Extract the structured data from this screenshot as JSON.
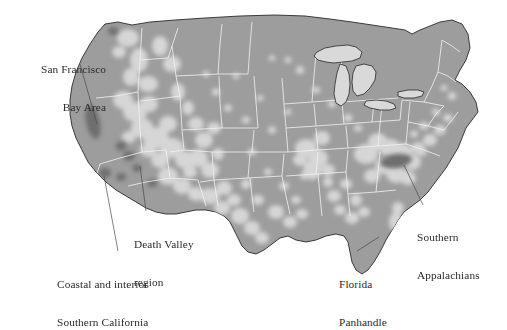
{
  "figure": {
    "type": "map",
    "region": "Contiguous United States",
    "style": "grayscale shaded density map with state boundaries",
    "background_color": "#ffffff",
    "colors": {
      "base_land": "#9d9d9d",
      "light_zone": "#d6d6d6",
      "dark_hotspot": "#6e6e6e",
      "state_border": "#f2f2f2",
      "coastline": "#2a2a2a",
      "lake_fill": "#d9d9d9",
      "label_text": "#2b2b2b",
      "leader_line": "#4a4a4a"
    }
  },
  "annotations": [
    {
      "id": "san-francisco-bay-area",
      "lines": [
        "San Francisco",
        "Bay Area"
      ],
      "line1": "San Francisco",
      "line2": "Bay Area",
      "anchor": {
        "x": 97,
        "y": 124
      },
      "leader_from": {
        "x": 80,
        "y": 64
      }
    },
    {
      "id": "death-valley-region",
      "lines": [
        "Death Valley",
        "region"
      ],
      "line1": "Death Valley",
      "line2": "region",
      "anchor": {
        "x": 140,
        "y": 166
      },
      "leader_from": {
        "x": 146,
        "y": 211
      }
    },
    {
      "id": "coastal-interior-southern-california",
      "lines": [
        "Coastal and interior",
        "Southern California"
      ],
      "line1": "Coastal and interior",
      "line2": "Southern California",
      "anchor": {
        "x": 104,
        "y": 176
      },
      "leader_from": {
        "x": 118,
        "y": 251
      }
    },
    {
      "id": "florida-panhandle",
      "lines": [
        "Florida",
        "Panhandle"
      ],
      "line1": "Florida",
      "line2": "Panhandle",
      "anchor": {
        "x": 379,
        "y": 237
      },
      "leader_from": {
        "x": 357,
        "y": 251
      }
    },
    {
      "id": "southern-appalachians",
      "lines": [
        "Southern",
        "Appalachians"
      ],
      "line1": "Southern",
      "line2": "Appalachians",
      "anchor": {
        "x": 404,
        "y": 165
      },
      "leader_from": {
        "x": 423,
        "y": 205
      }
    }
  ],
  "hotspots": [
    {
      "id": "san-francisco-bay-area",
      "cx": 93,
      "cy": 122,
      "rx": 7,
      "ry": 17,
      "rotate": -12
    },
    {
      "id": "southern-california-coastal",
      "cx": 106,
      "cy": 173,
      "rx": 6,
      "ry": 5,
      "rotate": 0
    },
    {
      "id": "southern-california-inland",
      "cx": 122,
      "cy": 177,
      "rx": 5,
      "ry": 4,
      "rotate": 0
    },
    {
      "id": "death-valley",
      "cx": 129,
      "cy": 156,
      "rx": 6,
      "ry": 5,
      "rotate": 0
    },
    {
      "id": "sierra-nevada",
      "cx": 121,
      "cy": 146,
      "rx": 5,
      "ry": 4,
      "rotate": 0
    },
    {
      "id": "mojave",
      "cx": 137,
      "cy": 168,
      "rx": 4,
      "ry": 3.5,
      "rotate": 0
    },
    {
      "id": "southern-appalachians",
      "cx": 396,
      "cy": 161,
      "rx": 16,
      "ry": 7,
      "rotate": -8
    },
    {
      "id": "arizona-spot",
      "cx": 152,
      "cy": 183,
      "rx": 5,
      "ry": 4,
      "rotate": 0
    },
    {
      "id": "pacific-northwest-coast",
      "cx": 113,
      "cy": 31,
      "rx": 5,
      "ry": 4,
      "rotate": 0
    }
  ]
}
